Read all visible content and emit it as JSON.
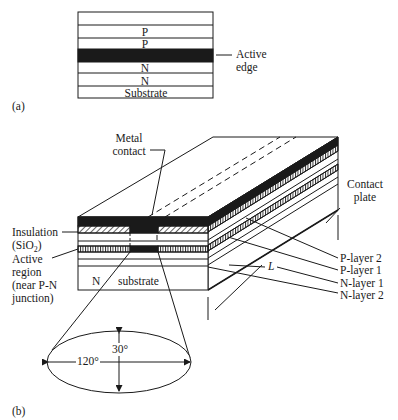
{
  "figure_a": {
    "panel_label": "(a)",
    "layers": [
      "",
      "P",
      "P",
      "",
      "N",
      "N",
      "Substrate"
    ],
    "active_layer_index": 3,
    "callout": {
      "line1": "Active",
      "line2": "edge"
    }
  },
  "figure_b": {
    "panel_label": "(b)",
    "labels": {
      "metal_contact": {
        "line1": "Metal",
        "line2": "contact"
      },
      "insulation": {
        "line1": "Insulation",
        "line2": "(SiO",
        "sub": "2",
        "tail": ")"
      },
      "active_region": {
        "line1": "Active",
        "line2": "region",
        "line3": "(near P-N",
        "line4": "junction)"
      },
      "contact_plate": {
        "line1": "Contact",
        "line2": "plate"
      },
      "p_layer_2": "P-layer 2",
      "p_layer_1": "P-layer 1",
      "n_layer_1": "N-layer 1",
      "n_layer_2": "N-layer 2",
      "length": "L",
      "substrate_n": "N",
      "substrate": "substrate"
    },
    "beam": {
      "horizontal_angle": "120°",
      "vertical_angle": "30°"
    }
  },
  "colors": {
    "ink": "#1a1a1a",
    "background": "#ffffff"
  }
}
